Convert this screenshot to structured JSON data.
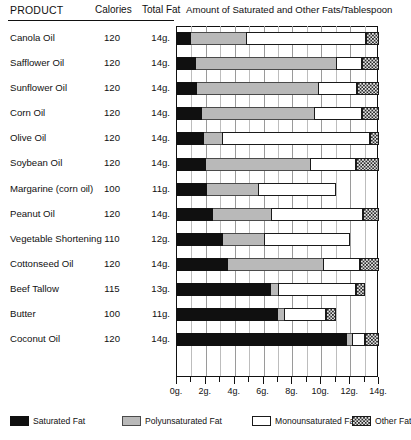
{
  "table": {
    "headers": {
      "product": "PRODUCT",
      "calories": "Calories",
      "total_fat": "Total Fat",
      "chart_header": "Amount of Saturated and Other Fats/Tablespoon"
    }
  },
  "legend": {
    "items": [
      {
        "key": "saturated",
        "label": "Saturated Fat",
        "color": "#101010"
      },
      {
        "key": "polyunsaturated",
        "label": "Polyunsaturated Fat",
        "color": "#b9b9b9"
      },
      {
        "key": "monounsaturated",
        "label": "Monounsaturated Fat",
        "color": "#ffffff"
      },
      {
        "key": "other",
        "label": "Other Fat",
        "color": "#e6e6e6"
      }
    ]
  },
  "chart_data": {
    "type": "bar",
    "orientation": "horizontal",
    "stacked": true,
    "title": "Amount of Saturated and Other Fats/Tablespoon",
    "xlabel": "",
    "ylabel": "",
    "xlim": [
      0,
      14
    ],
    "xunit": "g.",
    "xticks": [
      0,
      2,
      4,
      6,
      8,
      10,
      12,
      14
    ],
    "xticklabels": [
      "0g.",
      "2g.",
      "4g.",
      "6g.",
      "8g.",
      "10g.",
      "12g.",
      "14g."
    ],
    "xminorticks": [
      1,
      3,
      5,
      7,
      9,
      11,
      13
    ],
    "grid": true,
    "legend_position": "bottom",
    "series": [
      {
        "name": "Saturated Fat",
        "key": "saturated",
        "color": "#101010"
      },
      {
        "name": "Polyunsaturated Fat",
        "key": "polyunsaturated",
        "color": "#b9b9b9"
      },
      {
        "name": "Monounsaturated Fat",
        "key": "monounsaturated",
        "color": "#ffffff"
      },
      {
        "name": "Other Fat",
        "key": "other",
        "color": "#e6e6e6"
      }
    ],
    "categories": [
      "Canola Oil",
      "Safflower Oil",
      "Sunflower Oil",
      "Corn Oil",
      "Olive Oil",
      "Soybean Oil",
      "Margarine (corn oil)",
      "Peanut Oil",
      "Vegetable Shortening",
      "Cottonseed Oil",
      "Beef Tallow",
      "Butter",
      "Coconut Oil"
    ],
    "rows": [
      {
        "product": "Canola Oil",
        "calories": "120",
        "total_fat": "14g.",
        "saturated": 1.0,
        "polyunsaturated": 3.8,
        "monounsaturated": 8.3,
        "other": 0.9
      },
      {
        "product": "Safflower Oil",
        "calories": "120",
        "total_fat": "14g.",
        "saturated": 1.3,
        "polyunsaturated": 9.7,
        "monounsaturated": 1.8,
        "other": 1.2
      },
      {
        "product": "Sunflower Oil",
        "calories": "120",
        "total_fat": "14g.",
        "saturated": 1.4,
        "polyunsaturated": 8.4,
        "monounsaturated": 2.7,
        "other": 1.5
      },
      {
        "product": "Corn Oil",
        "calories": "120",
        "total_fat": "14g.",
        "saturated": 1.7,
        "polyunsaturated": 7.8,
        "monounsaturated": 3.3,
        "other": 1.2
      },
      {
        "product": "Olive Oil",
        "calories": "120",
        "total_fat": "14g.",
        "saturated": 1.9,
        "polyunsaturated": 1.2,
        "monounsaturated": 10.3,
        "other": 0.6
      },
      {
        "product": "Soybean Oil",
        "calories": "120",
        "total_fat": "14g.",
        "saturated": 2.0,
        "polyunsaturated": 7.2,
        "monounsaturated": 3.2,
        "other": 1.6
      },
      {
        "product": "Margarine (corn oil)",
        "calories": "100",
        "total_fat": "11g.",
        "saturated": 2.1,
        "polyunsaturated": 3.5,
        "monounsaturated": 5.4,
        "other": 0.0
      },
      {
        "product": "Peanut Oil",
        "calories": "120",
        "total_fat": "14g.",
        "saturated": 2.5,
        "polyunsaturated": 4.0,
        "monounsaturated": 6.4,
        "other": 1.1
      },
      {
        "product": "Vegetable Shortening",
        "calories": "110",
        "total_fat": "12g.",
        "saturated": 3.2,
        "polyunsaturated": 2.8,
        "monounsaturated": 6.0,
        "other": 0.0
      },
      {
        "product": "Cottonseed Oil",
        "calories": "120",
        "total_fat": "14g.",
        "saturated": 3.5,
        "polyunsaturated": 6.6,
        "monounsaturated": 2.6,
        "other": 1.3
      },
      {
        "product": "Beef Tallow",
        "calories": "115",
        "total_fat": "13g.",
        "saturated": 6.5,
        "polyunsaturated": 0.5,
        "monounsaturated": 5.4,
        "other": 0.6
      },
      {
        "product": "Butter",
        "calories": "100",
        "total_fat": "11g.",
        "saturated": 7.0,
        "polyunsaturated": 0.4,
        "monounsaturated": 2.9,
        "other": 0.7
      },
      {
        "product": "Coconut Oil",
        "calories": "120",
        "total_fat": "14g.",
        "saturated": 11.8,
        "polyunsaturated": 0.3,
        "monounsaturated": 0.9,
        "other": 1.0
      }
    ]
  }
}
